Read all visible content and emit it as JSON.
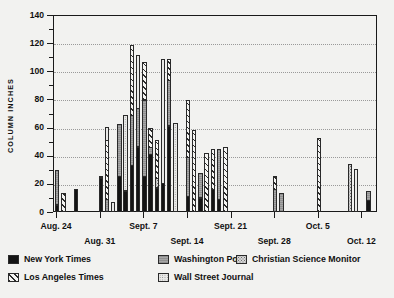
{
  "chart_data": {
    "type": "bar",
    "stacked": true,
    "title": "",
    "xlabel": "",
    "ylabel": "COLUMN INCHES",
    "ylim": [
      0,
      140
    ],
    "ytick_values": [
      0,
      20,
      40,
      60,
      80,
      100,
      120,
      140
    ],
    "ytick_labels": [
      "0",
      "20",
      "40",
      "60",
      "80",
      "100",
      "120",
      "140"
    ],
    "grid": "horizontal-dotted",
    "legend_position": "below-plot",
    "xtick_labels": [
      "Aug. 24",
      "Aug. 31",
      "Sept. 7",
      "Sept. 14",
      "Sept. 21",
      "Sept. 28",
      "Oct. 5",
      "Oct. 12"
    ],
    "xtick_indices": [
      0,
      7,
      14,
      21,
      28,
      35,
      42,
      49
    ],
    "series": [
      {
        "name": "New York Times",
        "key": "nyt",
        "pattern": "solid-black"
      },
      {
        "name": "Washington Post",
        "key": "wp",
        "pattern": "gray-horizontal-lines"
      },
      {
        "name": "Christian Science Monitor",
        "key": "csm",
        "pattern": "light-coarse-dots"
      },
      {
        "name": "Los Angeles Times",
        "key": "lat",
        "pattern": "diagonal-hatch"
      },
      {
        "name": "Wall Street Journal",
        "key": "wsj",
        "pattern": "fine-dots"
      }
    ],
    "bars": [
      {
        "x": 0,
        "nyt": 5,
        "wp": 25,
        "csm": 0,
        "lat": 0,
        "wsj": 0
      },
      {
        "x": 1,
        "nyt": 0,
        "wp": 0,
        "csm": 0,
        "lat": 13,
        "wsj": 0
      },
      {
        "x": 3,
        "nyt": 16,
        "wp": 0,
        "csm": 0,
        "lat": 0,
        "wsj": 0
      },
      {
        "x": 7,
        "nyt": 24,
        "wp": 2,
        "csm": 0,
        "lat": 0,
        "wsj": 0
      },
      {
        "x": 8,
        "nyt": 0,
        "wp": 9,
        "csm": 0,
        "lat": 42,
        "wsj": 10
      },
      {
        "x": 9,
        "nyt": 0,
        "wp": 0,
        "csm": 0,
        "lat": 0,
        "wsj": 7
      },
      {
        "x": 10,
        "nyt": 25,
        "wp": 38,
        "csm": 0,
        "lat": 0,
        "wsj": 0
      },
      {
        "x": 11,
        "nyt": 15,
        "wp": 0,
        "csm": 0,
        "lat": 0,
        "wsj": 54
      },
      {
        "x": 12,
        "nyt": 33,
        "wp": 36,
        "csm": 0,
        "lat": 50,
        "wsj": 0
      },
      {
        "x": 13,
        "nyt": 46,
        "wp": 28,
        "csm": 0,
        "lat": 0,
        "wsj": 38
      },
      {
        "x": 14,
        "nyt": 25,
        "wp": 55,
        "csm": 0,
        "lat": 27,
        "wsj": 0
      },
      {
        "x": 15,
        "nyt": 41,
        "wp": 5,
        "csm": 0,
        "lat": 14,
        "wsj": 0
      },
      {
        "x": 16,
        "nyt": 17,
        "wp": 0,
        "csm": 7,
        "lat": 28,
        "wsj": 0
      },
      {
        "x": 17,
        "nyt": 20,
        "wp": 0,
        "csm": 0,
        "lat": 0,
        "wsj": 89
      },
      {
        "x": 18,
        "nyt": 61,
        "wp": 33,
        "csm": 0,
        "lat": 15,
        "wsj": 0
      },
      {
        "x": 19,
        "nyt": 0,
        "wp": 0,
        "csm": 0,
        "lat": 0,
        "wsj": 63
      },
      {
        "x": 21,
        "nyt": 11,
        "wp": 28,
        "csm": 0,
        "lat": 41,
        "wsj": 0
      },
      {
        "x": 22,
        "nyt": 0,
        "wp": 0,
        "csm": 0,
        "lat": 58,
        "wsj": 0
      },
      {
        "x": 23,
        "nyt": 10,
        "wp": 18,
        "csm": 0,
        "lat": 0,
        "wsj": 0
      },
      {
        "x": 24,
        "nyt": 0,
        "wp": 0,
        "csm": 0,
        "lat": 42,
        "wsj": 0
      },
      {
        "x": 25,
        "nyt": 16,
        "wp": 0,
        "csm": 0,
        "lat": 29,
        "wsj": 0
      },
      {
        "x": 26,
        "nyt": 9,
        "wp": 36,
        "csm": 0,
        "lat": 0,
        "wsj": 0
      },
      {
        "x": 27,
        "nyt": 0,
        "wp": 0,
        "csm": 0,
        "lat": 46,
        "wsj": 0
      },
      {
        "x": 35,
        "nyt": 0,
        "wp": 16,
        "csm": 0,
        "lat": 10,
        "wsj": 0
      },
      {
        "x": 36,
        "nyt": 0,
        "wp": 13,
        "csm": 0,
        "lat": 0,
        "wsj": 0
      },
      {
        "x": 42,
        "nyt": 0,
        "wp": 0,
        "csm": 0,
        "lat": 52,
        "wsj": 0
      },
      {
        "x": 47,
        "nyt": 0,
        "wp": 0,
        "csm": 34,
        "lat": 0,
        "wsj": 0
      },
      {
        "x": 48,
        "nyt": 0,
        "wp": 0,
        "csm": 0,
        "lat": 0,
        "wsj": 30
      },
      {
        "x": 50,
        "nyt": 8,
        "wp": 7,
        "csm": 0,
        "lat": 0,
        "wsj": 0
      }
    ]
  },
  "legend": {
    "items": [
      {
        "label": "New York Times",
        "key": "nyt"
      },
      {
        "label": "Washington Post",
        "key": "wp"
      },
      {
        "label": "Christian Science Monitor",
        "key": "csm"
      },
      {
        "label": "Los Angeles Times",
        "key": "lat"
      },
      {
        "label": "Wall Street Journal",
        "key": "wsj"
      }
    ]
  },
  "colors": {
    "new_york_times": "#141414",
    "washington_post": "#9b9b9b",
    "christian_science_monitor": "#d6d6d6",
    "los_angeles_times": "#f4f4f2",
    "wall_street_journal": "#e9e9e7",
    "axis": "#1a1a1a",
    "grid": "#9a9a9a",
    "background": "#f2f2f0"
  }
}
